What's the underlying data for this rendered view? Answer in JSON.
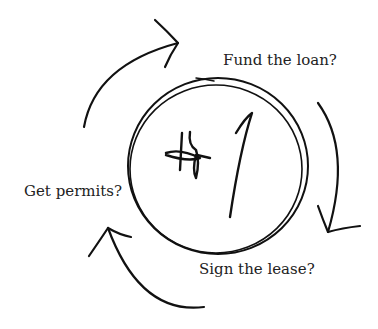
{
  "diagram": {
    "center_label": "#1",
    "steps": [
      {
        "id": "fund",
        "label": "Fund the loan?"
      },
      {
        "id": "lease",
        "label": "Sign the lease?"
      },
      {
        "id": "permits",
        "label": "Get permits?"
      }
    ],
    "flow": "circular, clockwise arrows around a central circle",
    "stroke_color": "#111111",
    "text_color": "#222222"
  }
}
